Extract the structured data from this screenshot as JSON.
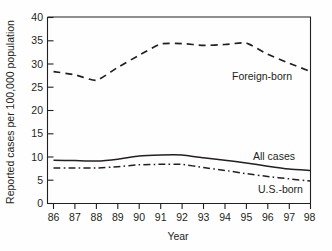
{
  "chart_data": {
    "type": "line",
    "title": "",
    "xlabel": "Year",
    "ylabel": "Reported cases per 100,000 population",
    "x": [
      86,
      87,
      88,
      89,
      90,
      91,
      92,
      93,
      94,
      95,
      96,
      97,
      98
    ],
    "xtick_labels": [
      "86",
      "87",
      "88",
      "89",
      "90",
      "91",
      "92",
      "93",
      "94",
      "95",
      "96",
      "97",
      "98"
    ],
    "ytick_labels": [
      "0",
      "5",
      "10",
      "15",
      "20",
      "25",
      "30",
      "35",
      "40"
    ],
    "yticks": [
      0,
      5,
      10,
      15,
      20,
      25,
      30,
      35,
      40
    ],
    "xlim": [
      86,
      98
    ],
    "ylim": [
      0,
      40
    ],
    "grid": false,
    "legend_position": "inline-right",
    "series": [
      {
        "name": "Foreign-born",
        "style": "dashed",
        "color": "#231f20",
        "values": [
          28.3,
          27.6,
          26.4,
          29.2,
          31.8,
          34.2,
          34.3,
          33.9,
          34.1,
          34.4,
          32.0,
          30.1,
          28.3
        ]
      },
      {
        "name": "All cases",
        "style": "solid",
        "color": "#231f20",
        "values": [
          9.3,
          9.2,
          9.1,
          9.5,
          10.2,
          10.4,
          10.4,
          9.8,
          9.3,
          8.7,
          8.0,
          7.4,
          7.1
        ]
      },
      {
        "name": "U.S.-born",
        "style": "dash-dot",
        "color": "#231f20",
        "values": [
          7.6,
          7.6,
          7.6,
          7.9,
          8.3,
          8.4,
          8.4,
          7.7,
          7.1,
          6.4,
          5.8,
          5.3,
          4.8
        ]
      }
    ]
  },
  "labels": {
    "foreign_born": "Foreign-born",
    "all_cases": "All cases",
    "us_born": "U.S.-born",
    "y_axis_title": "Reported cases per 100,000 population",
    "x_axis_title": "Year"
  },
  "ytick_text": {
    "t0": "0",
    "t5": "5",
    "t10": "10",
    "t15": "15",
    "t20": "20",
    "t25": "25",
    "t30": "30",
    "t35": "35",
    "t40": "40"
  },
  "xtick_text": {
    "t86": "86",
    "t87": "87",
    "t88": "88",
    "t89": "89",
    "t90": "90",
    "t91": "91",
    "t92": "92",
    "t93": "93",
    "t94": "94",
    "t95": "95",
    "t96": "96",
    "t97": "97",
    "t98": "98"
  }
}
